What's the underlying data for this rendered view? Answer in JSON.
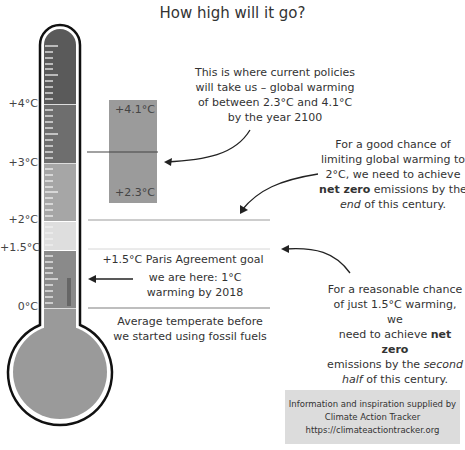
{
  "subtitle": "How high will it go?",
  "thermometer": {
    "labels": [
      {
        "text": "+4°C",
        "y": 104
      },
      {
        "text": "+3°C",
        "y": 163
      },
      {
        "text": "+2°C",
        "y": 221
      },
      {
        "text": "+1.5°C",
        "y": 250
      },
      {
        "text": "0°C",
        "y": 308
      }
    ],
    "bands": [
      {
        "name": "above-4",
        "color": "#5a5a5a"
      },
      {
        "name": "3-to-4",
        "color": "#6e6e6e"
      },
      {
        "name": "2-to-3",
        "color": "#a6a6a6"
      },
      {
        "name": "1.5-to-2",
        "color": "#dedede"
      },
      {
        "name": "0-to-1.5",
        "color": "#8a8a8a"
      }
    ],
    "current_level_color": "#6a6a6a"
  },
  "projection_box": {
    "top_label": "+4.1°C",
    "bottom_label": "+2.3°C",
    "color": "#9b9b9b"
  },
  "annotations": {
    "current_policies": [
      "This is where current policies",
      "will take us – global warming",
      "of between 2.3°C and 4.1°C",
      "by the year 2100"
    ],
    "two_degrees": {
      "line1": "For a good chance of",
      "line2": "limiting global warming to",
      "line3": "2°C, we need to achieve",
      "line4_bold": "net zero",
      "line4_rest": " emissions by the",
      "line5_italic": "end",
      "line5_rest": " of this century."
    },
    "paris_goal": "+1.5°C Paris Agreement goal",
    "we_are_here": [
      "we are here: 1°C",
      "warming by 2018"
    ],
    "one_point_five": {
      "line1": "For a reasonable chance",
      "line2": "of just 1.5°C warming, we",
      "line3_pre": "need to achieve ",
      "line3_bold": "net zero",
      "line4_pre": "emissions by the ",
      "line4_italic": "second",
      "line5_italic": "half",
      "line5_rest": " of this century."
    },
    "baseline": [
      "Average temperate before",
      "we started using fossil fuels"
    ]
  },
  "credit": {
    "line1": "Information and inspiration supplied by",
    "line2": "Climate Action Tracker",
    "line3": "https://climateactiontracker.org"
  }
}
